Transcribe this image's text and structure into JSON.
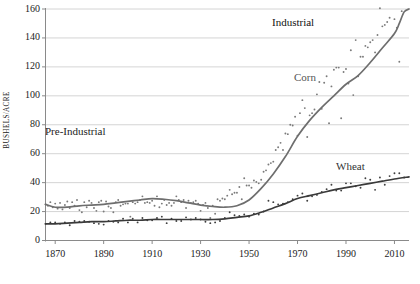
{
  "figure": {
    "background_color": "#ffffff",
    "width": 420,
    "height": 284
  },
  "axis_titles": {
    "y": "BUSHELS/ACRE",
    "x": ""
  },
  "annotations": {
    "pre_industrial": "Pre-Industrial",
    "industrial": "Industrial",
    "corn": "Corn",
    "wheat": "Wheat"
  },
  "colors": {
    "corn_line": "#6e6e6e",
    "wheat_line": "#3a3a3a",
    "corn_points": "#7a7a7a",
    "wheat_points": "#3f3f3f",
    "gridline": "#c9c9c9",
    "axis": "#8a8a8a",
    "text": "#1c1c1c"
  },
  "chart_data": {
    "type": "line",
    "title": "",
    "subtitle": "",
    "xlabel": "",
    "ylabel": "BUSHELS/ACRE",
    "xlim": [
      1866,
      2016
    ],
    "ylim": [
      0,
      160
    ],
    "grid": true,
    "grid_axis": "y",
    "legend": "inline-labels",
    "legend_position": "on-plot",
    "yticks": [
      0,
      20,
      40,
      60,
      80,
      100,
      120,
      140,
      160
    ],
    "ytick_labels": [
      "0",
      "20",
      "40",
      "60",
      "80",
      "100",
      "120",
      "140",
      "160"
    ],
    "xticks": [
      1870,
      1890,
      1910,
      1930,
      1950,
      1970,
      1990,
      2010
    ],
    "xtick_labels": [
      "1870",
      "1890",
      "1910",
      "1930",
      "1950",
      "1970",
      "1990",
      "2010"
    ],
    "annotations": [
      {
        "text": "Pre-Industrial",
        "x": 1875,
        "y": 75
      },
      {
        "text": "Industrial",
        "x": 1975,
        "y": 152
      },
      {
        "text": "Corn",
        "x": 1979,
        "y": 113
      },
      {
        "text": "Wheat",
        "x": 1995,
        "y": 52
      }
    ],
    "series": [
      {
        "name": "Corn",
        "style": "smoothed-trend-with-scatter",
        "color": "#6e6e6e",
        "x": [
          1866,
          1870,
          1875,
          1880,
          1885,
          1890,
          1895,
          1900,
          1905,
          1910,
          1915,
          1920,
          1925,
          1930,
          1935,
          1940,
          1945,
          1950,
          1955,
          1960,
          1965,
          1970,
          1975,
          1980,
          1985,
          1990,
          1995,
          2000,
          2005,
          2010,
          2012,
          2014,
          2016
        ],
        "values": [
          25,
          23,
          23,
          24,
          24.5,
          25,
          26,
          27,
          28,
          29,
          28.5,
          27.5,
          26,
          24.5,
          23.5,
          23,
          24,
          28,
          36,
          46,
          58,
          72,
          83,
          92,
          100,
          108,
          114,
          123,
          133,
          143,
          150,
          158,
          160
        ]
      },
      {
        "name": "Wheat",
        "style": "smoothed-trend-with-scatter",
        "color": "#3a3a3a",
        "x": [
          1866,
          1870,
          1875,
          1880,
          1885,
          1890,
          1895,
          1900,
          1905,
          1910,
          1915,
          1920,
          1925,
          1930,
          1935,
          1940,
          1945,
          1950,
          1955,
          1960,
          1965,
          1970,
          1975,
          1980,
          1985,
          1990,
          1995,
          2000,
          2005,
          2010,
          2016
        ],
        "values": [
          11.5,
          11.5,
          12,
          12.5,
          13,
          13,
          13.5,
          14,
          14,
          14.5,
          14.5,
          14.5,
          14.5,
          14.5,
          14.5,
          15,
          16,
          17,
          19.5,
          22.5,
          25.5,
          29,
          31,
          33,
          35,
          36.5,
          38,
          39.5,
          41,
          42.5,
          44
        ]
      }
    ],
    "scatter": {
      "corn": [
        [
          1866,
          25.0
        ],
        [
          1867,
          24.0
        ],
        [
          1868,
          26.5
        ],
        [
          1869,
          23.0
        ],
        [
          1870,
          25.5
        ],
        [
          1871,
          22.0
        ],
        [
          1872,
          26.0
        ],
        [
          1873,
          21.5
        ],
        [
          1874,
          24.5
        ],
        [
          1875,
          27.0
        ],
        [
          1876,
          22.5
        ],
        [
          1877,
          26.5
        ],
        [
          1878,
          24.0
        ],
        [
          1879,
          28.0
        ],
        [
          1880,
          21.0
        ],
        [
          1881,
          19.5
        ],
        [
          1882,
          26.5
        ],
        [
          1883,
          23.0
        ],
        [
          1884,
          27.5
        ],
        [
          1885,
          26.0
        ],
        [
          1886,
          22.5
        ],
        [
          1887,
          20.5
        ],
        [
          1888,
          26.5
        ],
        [
          1889,
          27.5
        ],
        [
          1890,
          20.0
        ],
        [
          1891,
          27.0
        ],
        [
          1892,
          23.5
        ],
        [
          1893,
          22.5
        ],
        [
          1894,
          19.5
        ],
        [
          1895,
          26.5
        ],
        [
          1896,
          28.0
        ],
        [
          1897,
          24.0
        ],
        [
          1898,
          25.0
        ],
        [
          1899,
          25.5
        ],
        [
          1900,
          25.5
        ],
        [
          1901,
          16.5
        ],
        [
          1902,
          26.5
        ],
        [
          1903,
          25.5
        ],
        [
          1904,
          26.5
        ],
        [
          1905,
          28.0
        ],
        [
          1906,
          30.5
        ],
        [
          1907,
          26.0
        ],
        [
          1908,
          26.5
        ],
        [
          1909,
          26.0
        ],
        [
          1910,
          27.5
        ],
        [
          1911,
          24.0
        ],
        [
          1912,
          30.5
        ],
        [
          1913,
          23.0
        ],
        [
          1914,
          25.5
        ],
        [
          1915,
          28.0
        ],
        [
          1916,
          24.5
        ],
        [
          1917,
          26.0
        ],
        [
          1918,
          24.0
        ],
        [
          1919,
          26.0
        ],
        [
          1920,
          30.5
        ],
        [
          1921,
          28.0
        ],
        [
          1922,
          26.5
        ],
        [
          1923,
          28.0
        ],
        [
          1924,
          22.5
        ],
        [
          1925,
          27.5
        ],
        [
          1926,
          26.0
        ],
        [
          1927,
          26.5
        ],
        [
          1928,
          27.5
        ],
        [
          1929,
          25.5
        ],
        [
          1930,
          20.5
        ],
        [
          1931,
          24.5
        ],
        [
          1932,
          26.0
        ],
        [
          1933,
          22.5
        ],
        [
          1934,
          15.5
        ],
        [
          1935,
          24.0
        ],
        [
          1936,
          18.5
        ],
        [
          1937,
          28.5
        ],
        [
          1938,
          27.5
        ],
        [
          1939,
          29.0
        ],
        [
          1940,
          28.5
        ],
        [
          1941,
          31.0
        ],
        [
          1942,
          35.0
        ],
        [
          1943,
          32.0
        ],
        [
          1944,
          33.0
        ],
        [
          1945,
          33.0
        ],
        [
          1946,
          37.0
        ],
        [
          1947,
          28.5
        ],
        [
          1948,
          43.0
        ],
        [
          1949,
          38.0
        ],
        [
          1950,
          38.0
        ],
        [
          1951,
          36.5
        ],
        [
          1952,
          41.5
        ],
        [
          1953,
          40.5
        ],
        [
          1954,
          39.5
        ],
        [
          1955,
          42.0
        ],
        [
          1956,
          47.5
        ],
        [
          1957,
          48.5
        ],
        [
          1958,
          52.5
        ],
        [
          1959,
          53.5
        ],
        [
          1960,
          54.5
        ],
        [
          1961,
          62.5
        ],
        [
          1962,
          64.5
        ],
        [
          1963,
          67.5
        ],
        [
          1964,
          62.5
        ],
        [
          1965,
          74.0
        ],
        [
          1966,
          73.5
        ],
        [
          1967,
          80.0
        ],
        [
          1968,
          79.5
        ],
        [
          1969,
          85.5
        ],
        [
          1970,
          72.5
        ],
        [
          1971,
          88.0
        ],
        [
          1972,
          97.0
        ],
        [
          1973,
          91.5
        ],
        [
          1974,
          71.5
        ],
        [
          1975,
          86.5
        ],
        [
          1976,
          88.0
        ],
        [
          1977,
          90.5
        ],
        [
          1978,
          101.0
        ],
        [
          1979,
          109.5
        ],
        [
          1980,
          91.0
        ],
        [
          1981,
          109.0
        ],
        [
          1982,
          113.5
        ],
        [
          1983,
          81.0
        ],
        [
          1984,
          106.5
        ],
        [
          1985,
          118.0
        ],
        [
          1986,
          119.5
        ],
        [
          1987,
          119.5
        ],
        [
          1988,
          84.5
        ],
        [
          1989,
          116.5
        ],
        [
          1990,
          118.5
        ],
        [
          1991,
          108.5
        ],
        [
          1992,
          131.5
        ],
        [
          1993,
          100.5
        ],
        [
          1994,
          138.5
        ],
        [
          1995,
          113.5
        ],
        [
          1996,
          127.0
        ],
        [
          1997,
          127.0
        ],
        [
          1998,
          134.5
        ],
        [
          1999,
          133.5
        ],
        [
          2000,
          137.0
        ],
        [
          2001,
          138.5
        ],
        [
          2002,
          130.0
        ],
        [
          2003,
          142.0
        ],
        [
          2004,
          160.5
        ],
        [
          2005,
          148.0
        ],
        [
          2006,
          149.0
        ],
        [
          2007,
          151.0
        ],
        [
          2008,
          154.0
        ],
        [
          2009,
          165.0
        ],
        [
          2010,
          153.0
        ],
        [
          2011,
          147.0
        ],
        [
          2012,
          123.5
        ],
        [
          2013,
          158.5
        ],
        [
          2014,
          171.0
        ],
        [
          2015,
          168.5
        ]
      ],
      "wheat": [
        [
          1866,
          11.5
        ],
        [
          1868,
          12.5
        ],
        [
          1870,
          12.5
        ],
        [
          1872,
          11.5
        ],
        [
          1874,
          12.5
        ],
        [
          1876,
          10.5
        ],
        [
          1878,
          13.5
        ],
        [
          1880,
          13.0
        ],
        [
          1882,
          13.5
        ],
        [
          1884,
          13.0
        ],
        [
          1886,
          12.0
        ],
        [
          1888,
          11.5
        ],
        [
          1890,
          11.0
        ],
        [
          1892,
          13.5
        ],
        [
          1894,
          13.0
        ],
        [
          1896,
          12.5
        ],
        [
          1898,
          15.0
        ],
        [
          1900,
          12.5
        ],
        [
          1902,
          15.0
        ],
        [
          1904,
          12.5
        ],
        [
          1906,
          15.5
        ],
        [
          1908,
          14.0
        ],
        [
          1910,
          14.0
        ],
        [
          1912,
          15.5
        ],
        [
          1914,
          16.5
        ],
        [
          1916,
          12.0
        ],
        [
          1918,
          15.0
        ],
        [
          1920,
          13.5
        ],
        [
          1922,
          13.5
        ],
        [
          1924,
          16.0
        ],
        [
          1926,
          14.5
        ],
        [
          1928,
          15.5
        ],
        [
          1930,
          14.5
        ],
        [
          1932,
          13.0
        ],
        [
          1934,
          12.0
        ],
        [
          1936,
          12.5
        ],
        [
          1938,
          13.5
        ],
        [
          1940,
          15.5
        ],
        [
          1942,
          19.5
        ],
        [
          1944,
          17.5
        ],
        [
          1946,
          17.0
        ],
        [
          1948,
          18.0
        ],
        [
          1950,
          16.5
        ],
        [
          1952,
          18.5
        ],
        [
          1954,
          18.0
        ],
        [
          1956,
          20.0
        ],
        [
          1958,
          27.5
        ],
        [
          1960,
          26.5
        ],
        [
          1962,
          25.0
        ],
        [
          1964,
          25.5
        ],
        [
          1966,
          26.5
        ],
        [
          1968,
          28.5
        ],
        [
          1970,
          31.0
        ],
        [
          1972,
          32.5
        ],
        [
          1974,
          27.5
        ],
        [
          1976,
          30.5
        ],
        [
          1978,
          31.5
        ],
        [
          1980,
          33.5
        ],
        [
          1982,
          35.5
        ],
        [
          1984,
          38.5
        ],
        [
          1986,
          34.5
        ],
        [
          1988,
          34.5
        ],
        [
          1990,
          39.5
        ],
        [
          1992,
          39.5
        ],
        [
          1994,
          37.5
        ],
        [
          1996,
          36.5
        ],
        [
          1998,
          43.0
        ],
        [
          2000,
          42.0
        ],
        [
          2002,
          35.0
        ],
        [
          2004,
          43.5
        ],
        [
          2006,
          38.5
        ],
        [
          2008,
          44.5
        ],
        [
          2010,
          46.5
        ],
        [
          2012,
          46.5
        ],
        [
          2014,
          43.5
        ]
      ]
    }
  }
}
